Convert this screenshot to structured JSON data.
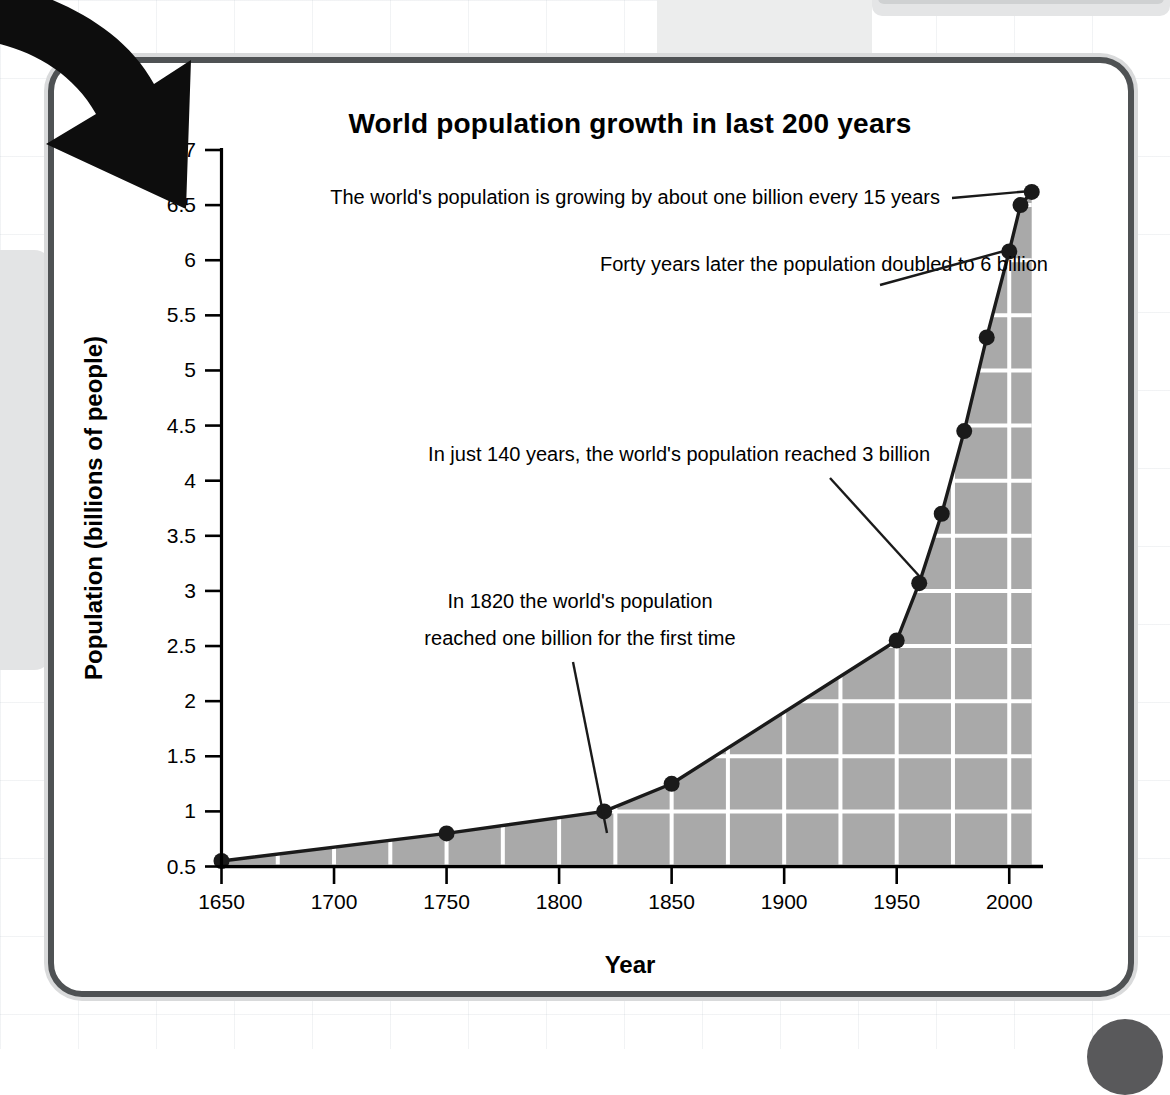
{
  "page": {
    "corner_badge": "corner-dot",
    "decor_arrow": "curved-down-right-arrow"
  },
  "chart_data": {
    "type": "area",
    "title": "World population growth in last 200 years",
    "xlabel": "Year",
    "ylabel": "Population (billions of people)",
    "xlim": [
      1650,
      2015
    ],
    "ylim": [
      0.5,
      7
    ],
    "xticks": [
      1650,
      1700,
      1750,
      1800,
      1850,
      1900,
      1950,
      2000
    ],
    "xticklabels": [
      "1650",
      "1700",
      "1750",
      "1800",
      "1850",
      "1900",
      "1950",
      "2000"
    ],
    "yticks": [
      0.5,
      1,
      1.5,
      2,
      2.5,
      3,
      3.5,
      4,
      4.5,
      5,
      5.5,
      6,
      6.5,
      7
    ],
    "yticklabels": [
      "0.5",
      "1",
      "1.5",
      "2",
      "2.5",
      "3",
      "3.5",
      "4",
      "4.5",
      "5",
      "5.5",
      "6",
      "6.5",
      "7"
    ],
    "grid": true,
    "legend": null,
    "x": [
      1650,
      1750,
      1820,
      1850,
      1950,
      1960,
      1970,
      1980,
      1990,
      2000,
      2005,
      2010
    ],
    "values": [
      0.55,
      0.8,
      1.0,
      1.25,
      2.55,
      3.07,
      3.7,
      4.45,
      5.3,
      6.08,
      6.5,
      6.62
    ],
    "series": [
      {
        "name": "World population",
        "x": [
          1650,
          1750,
          1820,
          1850,
          1950,
          1960,
          1970,
          1980,
          1990,
          2000,
          2005,
          2010
        ],
        "values": [
          0.55,
          0.8,
          1.0,
          1.25,
          2.55,
          3.07,
          3.7,
          4.45,
          5.3,
          6.08,
          6.5,
          6.62
        ]
      }
    ],
    "fill_color": "#a9a9a9",
    "line_color": "#1a1a1a",
    "marker_color": "#1a1a1a",
    "gridline_color": "#ffffff",
    "annotations": [
      {
        "id": "annot-15-years",
        "text": "The world's population is growing by about one billion every 15 years",
        "target_x": 2010,
        "target_y": 6.62
      },
      {
        "id": "annot-6-billion",
        "text": "Forty years later the population doubled to 6 billion",
        "target_x": 2000,
        "target_y": 6.08
      },
      {
        "id": "annot-3-billion",
        "text": "In just 140 years, the world's population reached 3 billion",
        "target_x": 1960,
        "target_y": 3.07
      },
      {
        "id": "annot-1820",
        "line1": "In 1820 the world's population",
        "line2": "reached one billion for the first time",
        "target_x": 1820,
        "target_y": 1.0
      }
    ]
  }
}
